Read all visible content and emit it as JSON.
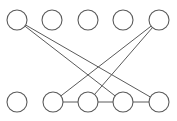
{
  "figure": {
    "name": "bipartite-graph-diagram",
    "width": 177,
    "height": 121,
    "background_color": "#ffffff",
    "node_stroke_color": "#5a5a5a",
    "node_fill_color": "#ffffff",
    "edge_stroke_color": "#5a5a5a",
    "node_radius": 10,
    "node_stroke_width": 1.1,
    "edge_stroke_width": 1
  },
  "chart_data": {
    "type": "scatter",
    "title": "",
    "xlabel": "",
    "ylabel": "",
    "grid": false,
    "legend": "none",
    "xlim": [
      0,
      177
    ],
    "ylim": [
      0,
      121
    ],
    "nodes": [
      {
        "id": "t1",
        "row": "top",
        "index": 1,
        "label": "",
        "cx": 17,
        "cy": 20,
        "r": 10,
        "degree": 2
      },
      {
        "id": "t2",
        "row": "top",
        "index": 2,
        "label": "",
        "cx": 52,
        "cy": 20,
        "r": 10,
        "degree": 0
      },
      {
        "id": "t3",
        "row": "top",
        "index": 3,
        "label": "",
        "cx": 88,
        "cy": 20,
        "r": 10,
        "degree": 0
      },
      {
        "id": "t4",
        "row": "top",
        "index": 4,
        "label": "",
        "cx": 123,
        "cy": 20,
        "r": 10,
        "degree": 0
      },
      {
        "id": "t5",
        "row": "top",
        "index": 5,
        "label": "",
        "cx": 159,
        "cy": 20,
        "r": 10,
        "degree": 2
      },
      {
        "id": "b1",
        "row": "bottom",
        "index": 1,
        "label": "",
        "cx": 17,
        "cy": 102,
        "r": 10,
        "degree": 0
      },
      {
        "id": "b2",
        "row": "bottom",
        "index": 2,
        "label": "",
        "cx": 53,
        "cy": 102,
        "r": 10,
        "degree": 2
      },
      {
        "id": "b3",
        "row": "bottom",
        "index": 3,
        "label": "",
        "cx": 88,
        "cy": 102,
        "r": 10,
        "degree": 3
      },
      {
        "id": "b4",
        "row": "bottom",
        "index": 4,
        "label": "",
        "cx": 123,
        "cy": 102,
        "r": 10,
        "degree": 3
      },
      {
        "id": "b5",
        "row": "bottom",
        "index": 5,
        "label": "",
        "cx": 159,
        "cy": 102,
        "r": 10,
        "degree": 2
      }
    ],
    "edges": [
      {
        "id": "e1",
        "from": "t1",
        "to": "b4",
        "x1": 17,
        "y1": 20,
        "x2": 123,
        "y2": 102,
        "kind": "diagonal"
      },
      {
        "id": "e2",
        "from": "t1",
        "to": "b5",
        "x1": 17,
        "y1": 20,
        "x2": 159,
        "y2": 102,
        "kind": "diagonal"
      },
      {
        "id": "e3",
        "from": "t5",
        "to": "b2",
        "x1": 159,
        "y1": 20,
        "x2": 53,
        "y2": 102,
        "kind": "diagonal"
      },
      {
        "id": "e4",
        "from": "t5",
        "to": "b3",
        "x1": 159,
        "y1": 20,
        "x2": 88,
        "y2": 102,
        "kind": "diagonal"
      },
      {
        "id": "e5",
        "from": "b2",
        "to": "b3",
        "x1": 53,
        "y1": 102,
        "x2": 88,
        "y2": 102,
        "kind": "horizontal"
      },
      {
        "id": "e6",
        "from": "b3",
        "to": "b4",
        "x1": 88,
        "y1": 102,
        "x2": 123,
        "y2": 102,
        "kind": "horizontal"
      },
      {
        "id": "e7",
        "from": "b4",
        "to": "b5",
        "x1": 123,
        "y1": 102,
        "x2": 159,
        "y2": 102,
        "kind": "horizontal"
      }
    ],
    "counts": {
      "top_nodes": 5,
      "bottom_nodes": 5,
      "total_nodes": 10,
      "diagonal_edges": 4,
      "horizontal_edges": 3,
      "total_edges": 7
    }
  }
}
